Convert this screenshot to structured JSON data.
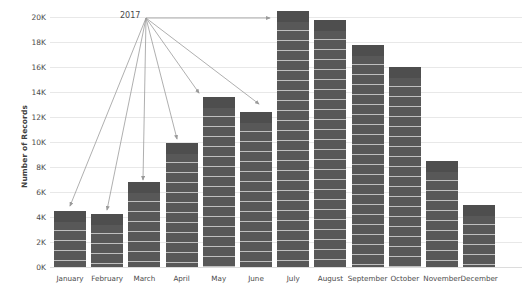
{
  "chart_data": {
    "type": "bar",
    "title": "",
    "subtitle": "",
    "xlabel": "",
    "ylabel": "Number of Records",
    "categories": [
      "January",
      "February",
      "March",
      "April",
      "May",
      "June",
      "July",
      "August",
      "September",
      "October",
      "November",
      "December"
    ],
    "values": [
      4500,
      4250,
      6800,
      9900,
      13600,
      12400,
      20500,
      19800,
      17800,
      16000,
      8500,
      5000
    ],
    "ylim": [
      0,
      20500
    ],
    "ytick_values": [
      0,
      2000,
      4000,
      6000,
      8000,
      10000,
      12000,
      14000,
      16000,
      18000,
      20000
    ],
    "ytick_labels": [
      "0K",
      "2K",
      "4K",
      "6K",
      "8K",
      "10K",
      "12K",
      "14K",
      "16K",
      "18K",
      "20K"
    ],
    "grid": true,
    "legend": "none",
    "bar_color": "#585858",
    "bar_cap_color": "#4e4e4e",
    "gridline_color": "#e8e8e8",
    "text_color": "#4a4a4a",
    "annotation_color": "#9a9a9a",
    "annotations": [
      {
        "label": "2017",
        "origin_x": 146,
        "origin_y": 18,
        "targets": [
          {
            "category": "January",
            "x": 70,
            "y": 206
          },
          {
            "category": "February",
            "x": 107,
            "y": 210
          },
          {
            "category": "March",
            "x": 143,
            "y": 180
          },
          {
            "category": "April",
            "x": 177,
            "y": 139
          },
          {
            "category": "May",
            "x": 199,
            "y": 93
          },
          {
            "category": "June",
            "x": 259,
            "y": 104
          },
          {
            "category": "July",
            "x": 270,
            "y": 18
          }
        ]
      }
    ]
  }
}
